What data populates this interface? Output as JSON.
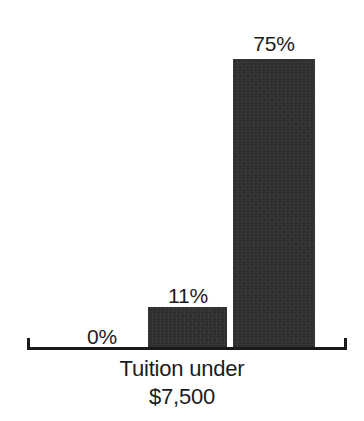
{
  "chart_data": {
    "type": "bar",
    "title": "",
    "subtitle": "",
    "xlabel": "Tuition under $7,500",
    "ylabel": "",
    "categories": [
      "",
      "",
      ""
    ],
    "values": [
      0,
      11,
      75
    ],
    "value_labels": [
      "0%",
      "11%",
      "75%"
    ],
    "ylim": [
      0,
      100
    ],
    "grid": false,
    "legend": null,
    "units": "percent",
    "series": [
      {
        "name": "Percent",
        "values": [
          0,
          11,
          75
        ]
      }
    ],
    "bar_color": "#2d2d2d",
    "background_color": "#ffffff",
    "axis_color": "#1a1a1a",
    "text_color": "#1c1c1c"
  },
  "axis": {
    "baseline_label": "x-axis-baseline",
    "left_cap_label": "left-end-cap",
    "right_cap_label": "right-end-cap"
  },
  "category": {
    "line1": "Tuition under",
    "line2": "$7,500"
  },
  "bars": [
    {
      "name": "bar-0-percent",
      "label": "0%",
      "value": 0,
      "left": 63,
      "width": 84,
      "height": 0,
      "label_center": 102,
      "label_bottom": 325
    },
    {
      "name": "bar-11-percent",
      "label": "11%",
      "value": 11,
      "left": 148,
      "width": 79,
      "height": 41,
      "label_center": 188,
      "label_bottom": 284
    },
    {
      "name": "bar-75-percent",
      "label": "75%",
      "value": 75,
      "left": 233,
      "width": 82,
      "height": 289,
      "label_center": 274,
      "label_bottom": 32
    }
  ]
}
